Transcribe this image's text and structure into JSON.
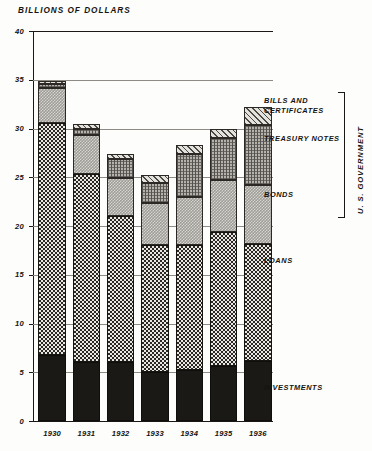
{
  "chart_data": {
    "type": "bar",
    "title": "BILLIONS OF DOLLARS",
    "subtitle": "",
    "xlabel": "",
    "ylabel": "BILLIONS OF DOLLARS",
    "stacked": true,
    "grid": true,
    "legend_position": "right",
    "ylim": [
      0,
      40
    ],
    "yticks": [
      0,
      5,
      10,
      15,
      20,
      25,
      30,
      35,
      40
    ],
    "ytick_labels": [
      "0",
      "5",
      "10",
      "15",
      "20",
      "25",
      "30",
      "35",
      "40"
    ],
    "categories": [
      "1930",
      "1931",
      "1932",
      "1933",
      "1934",
      "1935",
      "1936"
    ],
    "series": [
      {
        "name": "INVESTMENTS",
        "values": [
          6.8,
          6.1,
          6.0,
          5.0,
          5.2,
          5.6,
          6.2
        ]
      },
      {
        "name": "LOANS",
        "values": [
          23.8,
          19.2,
          15.0,
          13.0,
          12.9,
          13.8,
          12.0
        ]
      },
      {
        "name": "BONDS",
        "values": [
          3.6,
          4.0,
          3.9,
          4.4,
          4.9,
          5.3,
          6.0
        ]
      },
      {
        "name": "TREASURY NOTES",
        "values": [
          0.4,
          0.7,
          2.0,
          2.0,
          4.4,
          4.3,
          6.2
        ]
      },
      {
        "name": "BILLS AND CERTIFICATES",
        "values": [
          0.3,
          0.5,
          0.5,
          0.8,
          0.9,
          1.0,
          1.8
        ]
      }
    ],
    "totals": [
      34.9,
      30.5,
      27.4,
      25.2,
      28.3,
      30.0,
      32.2
    ],
    "group_bracket": {
      "label": "U. S. GOVERNMENT",
      "members": [
        "BONDS",
        "TREASURY NOTES",
        "BILLS AND CERTIFICATES"
      ]
    },
    "annotations": []
  },
  "legend": {
    "bills": "BILLS AND\nCERTIFICATES",
    "notes": "TREASURY NOTES",
    "bonds": "BONDS",
    "loans": "LOANS",
    "investments": "INVESTMENTS",
    "group": "U. S. GOVERNMENT"
  },
  "colors": {
    "ink": "#15130f",
    "paper": "#fdfdfb",
    "grid": "#8e8b84",
    "investments": "#1b1916",
    "loans": "#2a2724",
    "bonds": "#9e9c96",
    "notes": "#b4b2ac",
    "bills": "#e4e2dc"
  }
}
